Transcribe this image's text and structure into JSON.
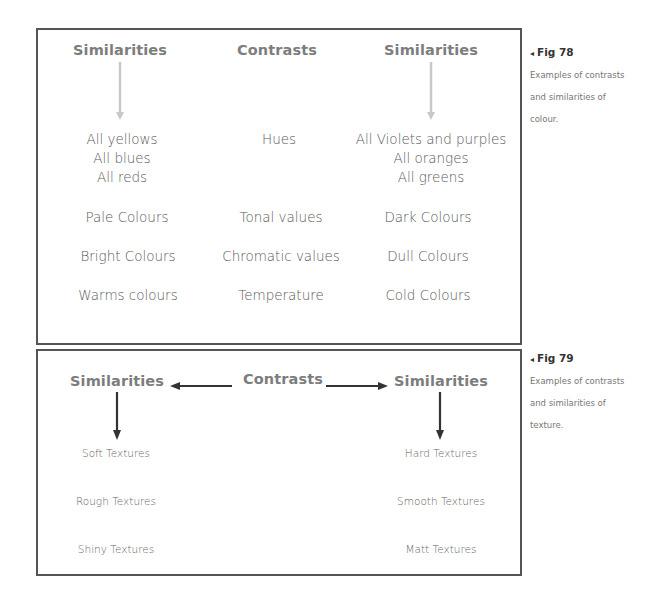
{
  "fig78": {
    "headers": [
      "Similarities",
      "Contrasts",
      "Similarities"
    ],
    "rows": [
      {
        "left": [
          "All yellows",
          "All blues",
          "All reds"
        ],
        "middle": "Hues",
        "right": [
          "All Violets and purples",
          "All oranges",
          "All greens"
        ]
      },
      {
        "left": "Pale Colours",
        "middle": "Tonal values",
        "right": "Dark Colours"
      },
      {
        "left": "Bright Colours",
        "middle": "Chromatic values",
        "right": "Dull Colours"
      },
      {
        "left": "Warms colours",
        "middle": "Temperature",
        "right": "Cold Colours"
      }
    ],
    "arrow_color": "#c8c8c8",
    "caption": {
      "label": "Fig 78",
      "marker": "◂",
      "lines": [
        "Examples of contrasts",
        "and similarities of",
        "colour."
      ]
    }
  },
  "fig79": {
    "headers": [
      "Similarities",
      "Contrasts",
      "Similarities"
    ],
    "left_items": [
      "Soft Textures",
      "Rough Textures",
      "Shiny Textures"
    ],
    "right_items": [
      "Hard Textures",
      "Smooth Textures",
      "Matt Textures"
    ],
    "arrow_color": "#333333",
    "caption": {
      "label": "Fig 79",
      "marker": "◂",
      "lines": [
        "Examples of contrasts",
        "and similarities of",
        "texture."
      ]
    }
  },
  "colors": {
    "border": "#555555",
    "header_text": "#7d7d7d",
    "body_text": "#5a5a5a"
  }
}
